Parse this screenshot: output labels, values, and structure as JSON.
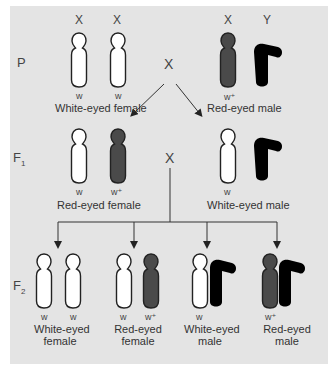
{
  "colors": {
    "background": "#e4e4e4",
    "x_white": "#ffffff",
    "x_red": "#4a4a4a",
    "y_chrom": "#000000",
    "outline": "#222222",
    "line": "#333333"
  },
  "generations": {
    "p": "P",
    "f1": "F",
    "f1_sub": "1",
    "f2": "F",
    "f2_sub": "2"
  },
  "cross_symbol": "X",
  "parental": {
    "female": {
      "chromosome_labels": [
        "X",
        "X"
      ],
      "alleles": [
        "w",
        "w"
      ],
      "phenotype": "White-eyed female"
    },
    "male": {
      "chromosome_labels": [
        "X",
        "Y"
      ],
      "alleles": [
        "w⁺"
      ],
      "phenotype": "Red-eyed male"
    }
  },
  "f1": {
    "female": {
      "alleles": [
        "w",
        "w⁺"
      ],
      "phenotype": "Red-eyed female"
    },
    "male": {
      "alleles": [
        "w"
      ],
      "phenotype": "White-eyed male"
    }
  },
  "f2": [
    {
      "alleles": [
        "w",
        "w"
      ],
      "phenotype_line1": "White-eyed",
      "phenotype_line2": "female"
    },
    {
      "alleles": [
        "w",
        "w⁺"
      ],
      "phenotype_line1": "Red-eyed",
      "phenotype_line2": "female"
    },
    {
      "alleles": [
        "w"
      ],
      "phenotype_line1": "White-eyed",
      "phenotype_line2": "male"
    },
    {
      "alleles": [
        "w⁺"
      ],
      "phenotype_line1": "Red-eyed",
      "phenotype_line2": "male"
    }
  ]
}
